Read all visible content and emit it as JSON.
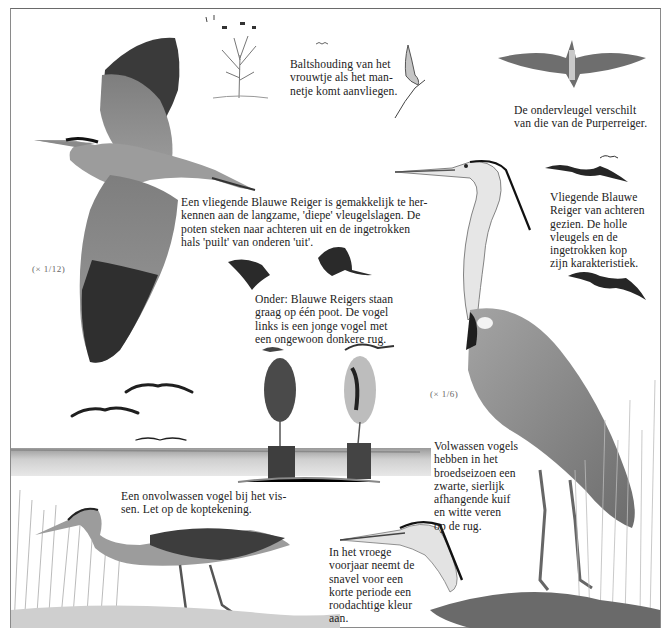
{
  "page": {
    "title": "Blauwe Reiger",
    "frame_color": "#8a8a8a",
    "ink_color": "#2a2a2a"
  },
  "captions": {
    "courtship": "Baltshouding van het vrouwtje als het man-netje komt aanvliegen.",
    "courtship_lines": [
      "Baltshouding van het",
      "vrouwtje als het man-",
      "netje komt aanvliegen."
    ],
    "underwing_lines": [
      "De ondervleugel verschilt",
      "van die van de Purperreiger."
    ],
    "flying_lines": [
      "Een vliegende Blauwe Reiger is gemakkelijk te her-",
      "kennen aan de langzame, 'diepe' vleugelslagen. De",
      "poten steken naar achteren uit en de ingetrokken",
      "hals 'puilt' van onderen 'uit'."
    ],
    "from_behind_lines": [
      "Vliegende Blauwe",
      "Reiger van achteren",
      "gezien. De holle",
      "vleugels en de",
      "ingetrokken kop",
      "zijn karakteristiek."
    ],
    "one_leg_lines": [
      "Onder: Blauwe Reigers staan",
      "graag op één poot. De vogel",
      "links is een jonge vogel met",
      "een ongewoon donkere rug."
    ],
    "adult_lines": [
      "Volwassen vogels",
      "hebben in het",
      "broedseizoen een",
      "zwarte, sierlijk",
      "afhangende kuif",
      "en witte veren",
      "op de rug."
    ],
    "juvenile_lines": [
      "Een onvolwassen vogel bij het vis-",
      "sen. Let op de koptekening."
    ],
    "spring_lines": [
      "In het vroege",
      "voorjaar neemt de",
      "snavel voor een",
      "korte periode een",
      "roodachtige kleur",
      "aan."
    ]
  },
  "scales": {
    "flying_heron": "(× 1/12)",
    "standing_heron": "(× 1/6)"
  },
  "illustrations": [
    {
      "name": "flying-heron-large",
      "label": "Vliegende Blauwe Reiger, zijaanzicht"
    },
    {
      "name": "colony-tree",
      "label": "Boom met nesten"
    },
    {
      "name": "courtship-heron",
      "label": "Baltsende reiger op tak"
    },
    {
      "name": "underwing-heron",
      "label": "Reiger van onderen"
    },
    {
      "name": "rear-flying-herons",
      "label": "Reigers van achteren"
    },
    {
      "name": "small-flying-herons",
      "label": "Kleine vliegende reigers"
    },
    {
      "name": "standing-herons-posts",
      "label": "Reigers op palen"
    },
    {
      "name": "adult-standing-heron",
      "label": "Volwassen Blauwe Reiger"
    },
    {
      "name": "juvenile-fishing-heron",
      "label": "Onvolwassen vissende reiger"
    },
    {
      "name": "heron-head-spring",
      "label": "Kop in het voorjaar"
    }
  ]
}
